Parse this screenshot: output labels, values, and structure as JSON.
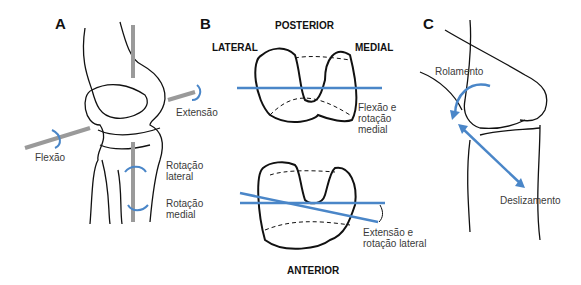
{
  "colors": {
    "accent": "#4a86c8",
    "line": "#111111",
    "rod": "#9a9a9a",
    "text": "#3a3a3a"
  },
  "panel_a": {
    "letter": "A",
    "labels": {
      "extension": "Extensão",
      "flexion": "Flexão",
      "lateral_rotation": [
        "Rotação",
        "lateral"
      ],
      "medial_rotation": [
        "Rotação",
        "medial"
      ]
    }
  },
  "panel_b": {
    "letter": "B",
    "directions": {
      "posterior": "POSTERIOR",
      "anterior": "ANTERIOR",
      "lateral": "LATERAL",
      "medial": "MEDIAL"
    },
    "top_label": [
      "Flexão e",
      "rotação",
      "medial"
    ],
    "bottom_label": [
      "Extensão e",
      "rotação lateral"
    ]
  },
  "panel_c": {
    "letter": "C",
    "labels": {
      "rolling": "Rolamento",
      "gliding": "Deslizamento"
    }
  }
}
